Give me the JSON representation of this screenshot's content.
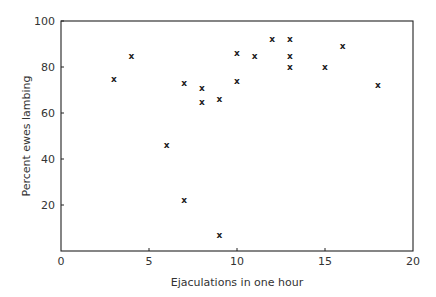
{
  "chart_data": {
    "type": "scatter",
    "title": "",
    "xlabel": "Ejaculations in one hour",
    "ylabel": "Percent ewes lambing",
    "xlim": [
      0,
      20
    ],
    "ylim": [
      0,
      100
    ],
    "x_ticks": [
      0,
      5,
      10,
      15,
      20
    ],
    "y_ticks": [
      20,
      40,
      60,
      80,
      100
    ],
    "grid": false,
    "legend": null,
    "marker": "x",
    "series": [
      {
        "name": "ewes lambing",
        "points": [
          {
            "x": 3,
            "y": 75
          },
          {
            "x": 4,
            "y": 85
          },
          {
            "x": 6,
            "y": 46
          },
          {
            "x": 7,
            "y": 73
          },
          {
            "x": 7,
            "y": 22
          },
          {
            "x": 8,
            "y": 71
          },
          {
            "x": 8,
            "y": 65
          },
          {
            "x": 9,
            "y": 66
          },
          {
            "x": 9,
            "y": 7
          },
          {
            "x": 10,
            "y": 86
          },
          {
            "x": 10,
            "y": 74
          },
          {
            "x": 11,
            "y": 85
          },
          {
            "x": 12,
            "y": 92
          },
          {
            "x": 13,
            "y": 92
          },
          {
            "x": 13,
            "y": 85
          },
          {
            "x": 13,
            "y": 80
          },
          {
            "x": 15,
            "y": 80
          },
          {
            "x": 16,
            "y": 89
          },
          {
            "x": 18,
            "y": 72
          }
        ]
      }
    ]
  },
  "layout": {
    "plot_left": 61,
    "plot_right": 413,
    "plot_top": 21,
    "plot_bottom": 251,
    "axis_color": "#222222",
    "marker_symbol": "x"
  }
}
